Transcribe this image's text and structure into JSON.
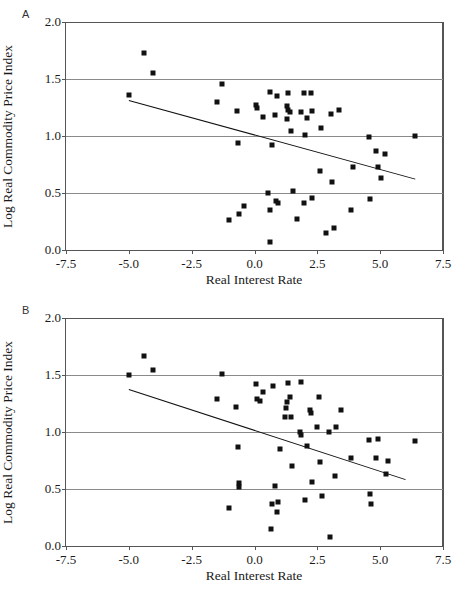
{
  "figure": {
    "panels": [
      {
        "letter": "A",
        "name": "panel-a",
        "xlabel": "Real Interest Rate",
        "ylabel": "Log Real Commodity Price Index",
        "xticks": [
          -7.5,
          -5.0,
          -2.5,
          0.0,
          2.5,
          5.0,
          7.5
        ],
        "xtick_labels": [
          "-7.5",
          "-5.0",
          "-2.5",
          "0.0",
          "2.5",
          "5.0",
          "7.5"
        ],
        "yticks": [
          0.0,
          0.5,
          1.0,
          1.5,
          2.0
        ],
        "ytick_labels": [
          "0.0",
          "0.5",
          "1.0",
          "1.5",
          "2.0"
        ],
        "xlim": [
          -7.5,
          7.5
        ],
        "ylim": [
          0.0,
          2.0
        ],
        "gridlines_y": [
          0.5,
          1.0,
          1.5
        ],
        "fit_line": {
          "x0": -5.0,
          "y0": 1.32,
          "x1": 6.4,
          "y1": 0.63
        }
      },
      {
        "letter": "B",
        "name": "panel-b",
        "xlabel": "Real Interest Rate",
        "ylabel": "Log Real Commodity Price Index",
        "xticks": [
          -7.5,
          -5.0,
          -2.5,
          0.0,
          2.5,
          5.0,
          7.5
        ],
        "xtick_labels": [
          "-7.5",
          "-5.0",
          "-2.5",
          "0.0",
          "2.5",
          "5.0",
          "7.5"
        ],
        "yticks": [
          0.0,
          0.5,
          1.0,
          1.5,
          2.0
        ],
        "ytick_labels": [
          "0.0",
          "0.5",
          "1.0",
          "1.5",
          "2.0"
        ],
        "xlim": [
          -7.5,
          7.5
        ],
        "ylim": [
          0.0,
          2.0
        ],
        "gridlines_y": [
          0.5,
          1.0,
          1.5
        ],
        "fit_line": {
          "x0": -5.0,
          "y0": 1.38,
          "x1": 6.0,
          "y1": 0.59
        }
      }
    ]
  },
  "chart_data": [
    {
      "type": "scatter",
      "panel": "A",
      "title": "",
      "xlabel": "Real Interest Rate",
      "ylabel": "Log Real Commodity Price Index",
      "xlim": [
        -7.5,
        7.5
      ],
      "ylim": [
        0.0,
        2.0
      ],
      "grid": true,
      "legend": null,
      "trendline": {
        "x": [
          -5.0,
          6.4
        ],
        "y": [
          1.32,
          0.63
        ]
      },
      "points": [
        [
          -4.4,
          1.73
        ],
        [
          -4.05,
          1.55
        ],
        [
          -5.0,
          1.36
        ],
        [
          -1.3,
          1.46
        ],
        [
          -1.5,
          1.3
        ],
        [
          -0.7,
          1.22
        ],
        [
          -0.65,
          0.94
        ],
        [
          -1.0,
          0.26
        ],
        [
          -0.6,
          0.32
        ],
        [
          -0.4,
          0.39
        ],
        [
          0.05,
          1.27
        ],
        [
          0.1,
          1.25
        ],
        [
          0.35,
          1.17
        ],
        [
          0.6,
          1.39
        ],
        [
          0.55,
          0.5
        ],
        [
          0.6,
          0.35
        ],
        [
          0.62,
          0.07
        ],
        [
          0.9,
          1.35
        ],
        [
          0.8,
          1.18
        ],
        [
          0.7,
          0.92
        ],
        [
          0.85,
          0.43
        ],
        [
          0.95,
          0.41
        ],
        [
          1.35,
          1.38
        ],
        [
          1.3,
          1.26
        ],
        [
          1.35,
          1.23
        ],
        [
          1.4,
          1.21
        ],
        [
          1.3,
          1.15
        ],
        [
          1.45,
          1.04
        ],
        [
          1.55,
          0.52
        ],
        [
          1.7,
          0.27
        ],
        [
          1.95,
          1.38
        ],
        [
          1.85,
          1.21
        ],
        [
          2.0,
          1.01
        ],
        [
          1.95,
          0.41
        ],
        [
          2.25,
          1.38
        ],
        [
          2.3,
          1.22
        ],
        [
          2.1,
          1.16
        ],
        [
          2.3,
          0.46
        ],
        [
          2.65,
          1.07
        ],
        [
          2.6,
          0.69
        ],
        [
          2.85,
          0.15
        ],
        [
          3.05,
          1.19
        ],
        [
          3.1,
          0.6
        ],
        [
          3.15,
          0.19
        ],
        [
          3.35,
          1.23
        ],
        [
          3.9,
          0.73
        ],
        [
          3.85,
          0.35
        ],
        [
          4.55,
          0.99
        ],
        [
          4.6,
          0.45
        ],
        [
          4.85,
          0.87
        ],
        [
          4.9,
          0.73
        ],
        [
          5.2,
          0.84
        ],
        [
          5.05,
          0.63
        ],
        [
          6.4,
          1.0
        ]
      ]
    },
    {
      "type": "scatter",
      "panel": "B",
      "title": "",
      "xlabel": "Real Interest Rate",
      "ylabel": "Log Real Commodity Price Index",
      "xlim": [
        -7.5,
        7.5
      ],
      "ylim": [
        0.0,
        2.0
      ],
      "grid": true,
      "legend": null,
      "trendline": {
        "x": [
          -5.0,
          6.0
        ],
        "y": [
          1.38,
          0.59
        ]
      },
      "points": [
        [
          -4.4,
          1.67
        ],
        [
          -4.05,
          1.54
        ],
        [
          -5.0,
          1.5
        ],
        [
          -1.3,
          1.51
        ],
        [
          -1.5,
          1.29
        ],
        [
          -0.75,
          1.22
        ],
        [
          -0.65,
          0.87
        ],
        [
          -0.6,
          0.55
        ],
        [
          -0.62,
          0.52
        ],
        [
          -1.0,
          0.33
        ],
        [
          0.05,
          1.42
        ],
        [
          0.1,
          1.29
        ],
        [
          0.2,
          1.27
        ],
        [
          0.35,
          1.35
        ],
        [
          0.75,
          1.4
        ],
        [
          0.7,
          0.37
        ],
        [
          0.65,
          0.15
        ],
        [
          0.8,
          0.53
        ],
        [
          0.95,
          0.39
        ],
        [
          0.9,
          0.3
        ],
        [
          1.0,
          0.85
        ],
        [
          1.35,
          1.43
        ],
        [
          1.3,
          1.26
        ],
        [
          1.4,
          1.31
        ],
        [
          1.25,
          1.21
        ],
        [
          1.2,
          1.13
        ],
        [
          1.45,
          1.13
        ],
        [
          1.5,
          0.7
        ],
        [
          1.85,
          1.44
        ],
        [
          1.8,
          1.0
        ],
        [
          1.85,
          0.97
        ],
        [
          2.0,
          0.4
        ],
        [
          2.2,
          1.19
        ],
        [
          2.25,
          1.17
        ],
        [
          2.1,
          0.88
        ],
        [
          2.3,
          0.56
        ],
        [
          2.55,
          1.31
        ],
        [
          2.5,
          1.04
        ],
        [
          2.6,
          0.74
        ],
        [
          2.7,
          0.44
        ],
        [
          2.95,
          1.0
        ],
        [
          3.0,
          0.08
        ],
        [
          3.25,
          1.04
        ],
        [
          3.2,
          0.61
        ],
        [
          3.45,
          1.19
        ],
        [
          3.85,
          0.77
        ],
        [
          4.55,
          0.93
        ],
        [
          4.6,
          0.46
        ],
        [
          4.65,
          0.37
        ],
        [
          4.9,
          0.94
        ],
        [
          4.85,
          0.77
        ],
        [
          5.25,
          0.63
        ],
        [
          5.3,
          0.75
        ],
        [
          6.4,
          0.92
        ]
      ]
    }
  ]
}
